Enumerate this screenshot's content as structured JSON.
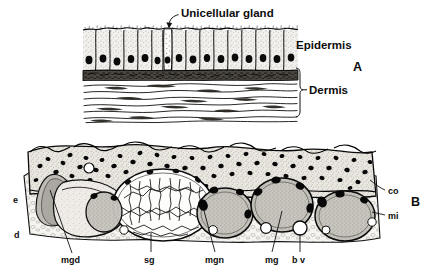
{
  "figure": {
    "title_visible": false,
    "background_color": "#ffffff",
    "ink_color": "#000000",
    "panels": [
      {
        "id": "A",
        "letter": "A",
        "description": "Columnar epidermis with unicellular gland over fibrous dermis",
        "callouts": [
          {
            "name": "unicellular-gland",
            "text": "Unicellular gland"
          }
        ],
        "brackets": [
          {
            "name": "epidermis",
            "text": "Epidermis"
          },
          {
            "name": "dermis",
            "text": "Dermis"
          }
        ]
      },
      {
        "id": "B",
        "letter": "B",
        "description": "Thick skin section showing mucous and serous glands in dermis",
        "labels": [
          {
            "key": "e",
            "text": "e"
          },
          {
            "key": "d",
            "text": "d"
          },
          {
            "key": "mgd",
            "text": "mgd"
          },
          {
            "key": "sg",
            "text": "sg"
          },
          {
            "key": "mgn",
            "text": "mgn"
          },
          {
            "key": "mg",
            "text": "mg"
          },
          {
            "key": "bv",
            "text": "b v"
          },
          {
            "key": "co",
            "text": "co"
          },
          {
            "key": "mi",
            "text": "mi"
          }
        ]
      }
    ]
  }
}
